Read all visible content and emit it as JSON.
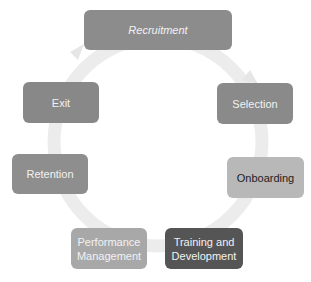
{
  "diagram": {
    "type": "cycle",
    "ring_color": "#ececec",
    "nodes": [
      {
        "id": "recruitment",
        "label": "Recruitment",
        "color": "#8c8c8c",
        "text_color": "#f2f2f2"
      },
      {
        "id": "selection",
        "label": "Selection",
        "color": "#8a8a8a",
        "text_color": "#f2f2f2"
      },
      {
        "id": "onboarding",
        "label": "Onboarding",
        "color": "#b8b8b8",
        "text_color": "#222222"
      },
      {
        "id": "training",
        "label": "Training and Development",
        "color": "#555555",
        "text_color": "#f2f2f2"
      },
      {
        "id": "performance",
        "label": "Performance Management",
        "color": "#a8a8a8",
        "text_color": "#f2f2f2"
      },
      {
        "id": "retention",
        "label": "Retention",
        "color": "#8e8e8e",
        "text_color": "#f2f2f2"
      },
      {
        "id": "exit",
        "label": "Exit",
        "color": "#888888",
        "text_color": "#f2f2f2"
      }
    ]
  }
}
